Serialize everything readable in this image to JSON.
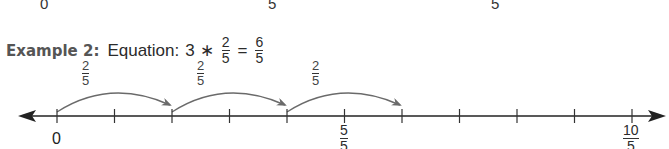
{
  "previous_example_remnant": {
    "labels": [
      {
        "text": "0",
        "x": 40
      },
      {
        "text": "5",
        "x": 270
      },
      {
        "text": "5",
        "x": 493
      }
    ]
  },
  "example": {
    "label": "Example 2:",
    "equation_prefix": "Equation:",
    "multiplier": "3",
    "operator": "∗",
    "fraction": {
      "num": "2",
      "den": "5"
    },
    "equals": "=",
    "result": {
      "num": "6",
      "den": "5"
    }
  },
  "jumps": [
    {
      "num": "2",
      "den": "5",
      "from_tick": 0,
      "to_tick": 2
    },
    {
      "num": "2",
      "den": "5",
      "from_tick": 2,
      "to_tick": 4
    },
    {
      "num": "2",
      "den": "5",
      "from_tick": 4,
      "to_tick": 6
    }
  ],
  "number_line": {
    "tick_count": 11,
    "tick_start_x": 57,
    "tick_spacing": 57.5,
    "axis_y": 116,
    "labels": [
      {
        "tick": 0,
        "text": "0"
      },
      {
        "tick": 5,
        "num": "5",
        "den": "5"
      },
      {
        "tick": 10,
        "num": "10",
        "den": "5"
      }
    ]
  },
  "colors": {
    "axis": "#222222",
    "arc": "#6a6a6a",
    "text": "#2b2b2b"
  }
}
